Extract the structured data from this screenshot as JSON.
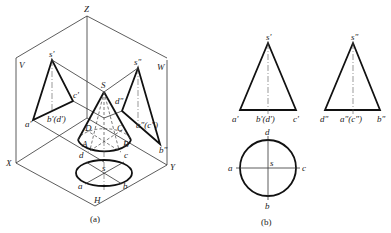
{
  "figure_a": {
    "caption": "(a)",
    "plane_labels": {
      "Z": "Z",
      "V": "V",
      "W": "W",
      "X": "X",
      "Y": "Y",
      "H": "H"
    },
    "apex": "S",
    "base_points": {
      "A": "A",
      "B": "B",
      "C": "C",
      "D": "D"
    },
    "v_projection": {
      "s": "s'",
      "a": "a'",
      "bd": "b'(d')",
      "c": "c'"
    },
    "w_projection": {
      "s": "s\"",
      "d": "d\"",
      "ac": "a\"(c\")",
      "b": "b\""
    },
    "h_projection": {
      "s": "s",
      "a": "a",
      "b": "b",
      "c": "c",
      "d": "d"
    }
  },
  "figure_b": {
    "caption": "(b)",
    "front_view": {
      "s": "s'",
      "a": "a'",
      "bd": "b'(d')",
      "c": "c'"
    },
    "side_view": {
      "s": "s\"",
      "d": "d\"",
      "ac": "a\"(c\")",
      "b": "b\""
    },
    "top_view": {
      "s": "s",
      "a": "a",
      "b": "b",
      "c": "c",
      "d": "d"
    }
  }
}
